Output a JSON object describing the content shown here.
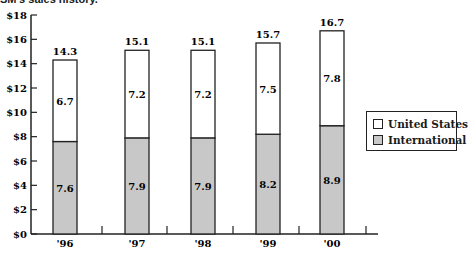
{
  "header": {
    "title": "SM's sales history."
  },
  "legend": {
    "items": [
      {
        "label": "United States",
        "color": "#ffffff"
      },
      {
        "label": "International",
        "color": "#c8c8c8"
      }
    ]
  },
  "chart_data": {
    "type": "bar",
    "stacked": true,
    "title": "SM's sales history.",
    "xlabel": "",
    "ylabel": "",
    "categories": [
      "'96",
      "'97",
      "'98",
      "'99",
      "'00"
    ],
    "series": [
      {
        "name": "International",
        "values": [
          7.6,
          7.9,
          7.9,
          8.2,
          8.9
        ],
        "color": "#c8c8c8"
      },
      {
        "name": "United States",
        "values": [
          6.7,
          7.2,
          7.2,
          7.5,
          7.8
        ],
        "color": "#ffffff"
      }
    ],
    "totals": [
      14.3,
      15.1,
      15.1,
      15.7,
      16.7
    ],
    "ylim": [
      0,
      18
    ],
    "yticks": [
      "$0",
      "$2",
      "$4",
      "$6",
      "$8",
      "$10",
      "$12",
      "$14",
      "$16",
      "$18"
    ],
    "grid": false,
    "legend_position": "right"
  }
}
